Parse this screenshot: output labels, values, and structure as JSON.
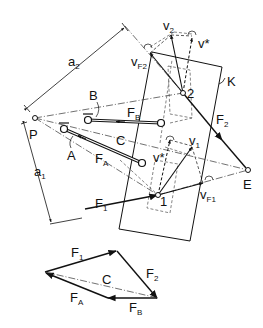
{
  "diagram": {
    "type": "mechanism-kinematics",
    "points": {
      "P": {
        "label": "P"
      },
      "E": {
        "label": "E"
      },
      "joint1": {
        "label": "1"
      },
      "joint2": {
        "label": "2"
      }
    },
    "labels": {
      "a2": {
        "main": "a",
        "sub": "2"
      },
      "a1": {
        "main": "a",
        "sub": "1"
      },
      "B": "B",
      "A": "A",
      "C": "C",
      "K": "K",
      "FB": {
        "main": "F",
        "sub": "B"
      },
      "FA": {
        "main": "F",
        "sub": "A"
      },
      "F1": {
        "main": "F",
        "sub": "1"
      },
      "F2": {
        "main": "F",
        "sub": "2"
      },
      "v2": {
        "main": "v",
        "sub": "2"
      },
      "vstar_top": "v*",
      "vF2": {
        "main": "v",
        "sub": "F2"
      },
      "v1": {
        "main": "v",
        "sub": "1"
      },
      "vstar_mid": "v*",
      "vF1": {
        "main": "v",
        "sub": "F1"
      }
    },
    "force_polygon": {
      "F1": {
        "main": "F",
        "sub": "1"
      },
      "F2": {
        "main": "F",
        "sub": "2"
      },
      "C": "C",
      "FA": {
        "main": "F",
        "sub": "A"
      },
      "FB": {
        "main": "F",
        "sub": "B"
      }
    }
  }
}
